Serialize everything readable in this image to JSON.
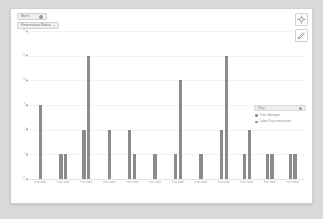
{
  "widget": {
    "title": "Bar Chart"
  },
  "controls": {
    "dimension_select": {
      "label": "Metric",
      "icon": "chevron-down-icon"
    },
    "filter_chip": {
      "label": "Reservation Status",
      "icon": "close-icon",
      "close_glyph": "×"
    }
  },
  "tools": {
    "focus_button": {
      "label": "Focus",
      "icon": "crosshair-icon"
    },
    "edit_button": {
      "label": "Edit",
      "icon": "pencil-icon"
    }
  },
  "legend": {
    "header": {
      "label": "Step",
      "icon": "chevron-down-icon"
    },
    "items": [
      {
        "label": "Time Manager",
        "color": "#8c8c8c"
      },
      {
        "label": "Labor Day reservation",
        "color": "#8c8c8c"
      }
    ]
  },
  "chart_data": {
    "type": "bar",
    "title": "",
    "xlabel": "",
    "ylabel": "",
    "ylim": [
      0,
      6
    ],
    "yticks": [
      0,
      1,
      2,
      3,
      4,
      5,
      6
    ],
    "ytick_labels": [
      "0",
      "1",
      "2",
      "3",
      "4",
      "5",
      "6"
    ],
    "grid": true,
    "legend_position": "right",
    "bar_color": "#8c8c8c",
    "categories": [
      "Full time",
      "Part time",
      "Full time",
      "Part time",
      "Full time",
      "Part time",
      "Full time",
      "Part time",
      "Full time",
      "Part time",
      "Full time",
      "Part time"
    ],
    "groups": [
      {
        "label": "Full time",
        "values": [
          3
        ]
      },
      {
        "label": "Part time",
        "values": [
          1,
          1
        ]
      },
      {
        "label": "Full time",
        "values": [
          2,
          5
        ]
      },
      {
        "label": "Part time",
        "values": [
          2
        ]
      },
      {
        "label": "Full time",
        "values": [
          2,
          1
        ]
      },
      {
        "label": "Part time",
        "values": [
          1
        ]
      },
      {
        "label": "Full time",
        "values": [
          1,
          4
        ]
      },
      {
        "label": "Part time",
        "values": [
          1
        ]
      },
      {
        "label": "Full time",
        "values": [
          2,
          5
        ]
      },
      {
        "label": "Part time",
        "values": [
          1,
          2
        ]
      },
      {
        "label": "Full time",
        "values": [
          1,
          1
        ]
      },
      {
        "label": "Part time",
        "values": [
          1,
          1
        ]
      }
    ],
    "series": [
      {
        "name": "Time Manager",
        "values": [
          3,
          1,
          2,
          2,
          2,
          1,
          1,
          1,
          2,
          1,
          1,
          1
        ]
      },
      {
        "name": "Labor Day reservation",
        "values": [
          0,
          1,
          5,
          0,
          1,
          0,
          4,
          0,
          5,
          2,
          1,
          1
        ]
      }
    ]
  }
}
